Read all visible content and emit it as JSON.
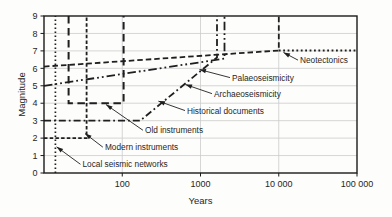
{
  "figure": {
    "kind": "scientific line figure"
  },
  "chart_data": {
    "type": "line",
    "title": "",
    "xlabel": "Years",
    "ylabel": "Magnitude",
    "x_axis": {
      "scale": "log",
      "range": [
        10,
        100000
      ],
      "ticks": [
        {
          "value": 100,
          "label": "100"
        },
        {
          "value": 1000,
          "label": "1000"
        },
        {
          "value": 10000,
          "label": "10 000"
        },
        {
          "value": 100000,
          "label": "100 000"
        }
      ]
    },
    "y_axis": {
      "scale": "linear",
      "range": [
        0,
        9
      ],
      "ticks": [
        {
          "value": 0,
          "label": "0"
        },
        {
          "value": 1,
          "label": "1"
        },
        {
          "value": 2,
          "label": "2"
        },
        {
          "value": 3,
          "label": "3"
        },
        {
          "value": 4,
          "label": "4"
        },
        {
          "value": 5,
          "label": "5"
        },
        {
          "value": 6,
          "label": "6"
        },
        {
          "value": 7,
          "label": "7"
        },
        {
          "value": 8,
          "label": "8"
        },
        {
          "value": 9,
          "label": "9"
        }
      ]
    },
    "grid": {
      "show": true,
      "horizontal_magnitudes": [
        1,
        2,
        3,
        4,
        5,
        6,
        7,
        8
      ],
      "vertical_years": [
        100,
        1000,
        10000
      ]
    },
    "series": [
      {
        "name": "Local seismic networks",
        "style": "dotted",
        "points": [
          [
            14,
            0
          ],
          [
            14,
            9
          ]
        ],
        "label_at": [
          31,
          0.5
        ],
        "arrow_tip": [
          14.5,
          1.5
        ]
      },
      {
        "name": "Modern instruments",
        "style": "dash-short",
        "points": [
          [
            10,
            2
          ],
          [
            35,
            2
          ],
          [
            35,
            9
          ]
        ],
        "label_at": [
          60,
          1.48
        ],
        "arrow_tip": [
          33.5,
          2.26
        ]
      },
      {
        "name": "Old instruments",
        "style": "dash-long",
        "points": [
          [
            20.6,
            9
          ],
          [
            20.6,
            4
          ],
          [
            104,
            4
          ],
          [
            104,
            9
          ]
        ],
        "label_at": [
          195,
          2.45
        ],
        "arrow_tip": [
          62,
          3.92
        ]
      },
      {
        "name": "Historical documents",
        "style": "dash-dot",
        "points": [
          [
            10,
            3
          ],
          [
            169,
            3
          ],
          [
            1626,
            6.62
          ],
          [
            1626,
            9
          ]
        ],
        "label_at": [
          672,
          3.58
        ],
        "arrow_tip": [
          290,
          4.12
        ]
      },
      {
        "name": "Archaeoseismicity",
        "style": "dash-dot-dot",
        "points": [
          [
            10,
            5.0
          ],
          [
            2027,
            6.56
          ],
          [
            2027,
            9
          ]
        ],
        "label_at": [
          1487,
          4.55
        ],
        "arrow_tip": [
          643,
          5.07
        ]
      },
      {
        "name": "Palaeoseismicity",
        "style": "dash-medium",
        "points": [
          [
            10,
            6.1
          ],
          [
            10000,
            7.02
          ],
          [
            10000,
            9
          ]
        ],
        "label_at": [
          2528,
          5.47
        ],
        "arrow_tip": [
          971,
          5.93
        ]
      },
      {
        "name": "Neotectonics",
        "style": "dotted-bold",
        "points": [
          [
            10000,
            7.02
          ],
          [
            100000,
            7.02
          ]
        ],
        "label_at": [
          18700,
          6.47
        ],
        "arrow_tip": [
          11500,
          6.91
        ]
      }
    ],
    "colors": {
      "line": "#1f1f1f",
      "frame": "#1a1a1a",
      "grid": "#cccccc",
      "text": "#262626"
    }
  }
}
